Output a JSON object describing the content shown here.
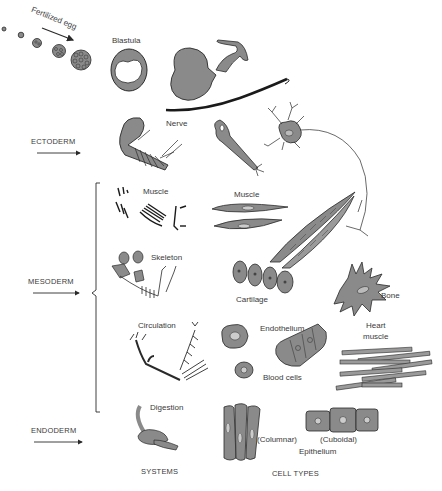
{
  "diagram": {
    "type": "embryonic germ layers to systems and cell types",
    "colors": {
      "fill": "#8a8a8a",
      "stroke": "#2a2a2a",
      "text": "#3a3a3a",
      "background": "#ffffff"
    },
    "top": {
      "fertilized_egg_label": "Fertilized egg",
      "blastula_label": "Blastula"
    },
    "germ_layers": [
      {
        "name": "ECTODERM"
      },
      {
        "name": "MESODERM"
      },
      {
        "name": "ENDODERM"
      }
    ],
    "systems": {
      "nerve": "Nerve",
      "muscle": "Muscle",
      "skeleton": "Skeleton",
      "circulation": "Circulation",
      "digestion": "Digestion"
    },
    "cell_types": {
      "muscle": "Muscle",
      "cartilage": "Cartilage",
      "bone": "Bone",
      "endothelium": "Endothelium",
      "blood_cells": "Blood cells",
      "heart_muscle_line1": "Heart",
      "heart_muscle_line2": "muscle",
      "columnar": "(Columnar)",
      "cuboidal": "(Cuboidal)",
      "epithelium": "Epithelium"
    },
    "captions": {
      "systems": "SYSTEMS",
      "cell_types": "CELL TYPES"
    }
  }
}
